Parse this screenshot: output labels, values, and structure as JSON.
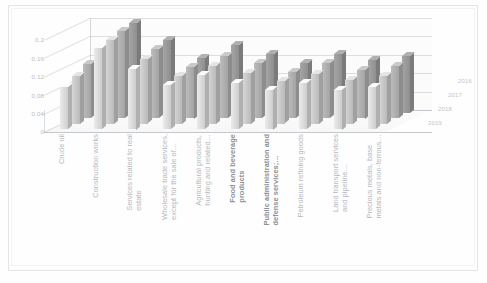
{
  "chart_data": {
    "type": "bar",
    "title": "",
    "subtitle": "",
    "xlabel": "",
    "ylabel": "",
    "ylim": [
      0,
      0.2
    ],
    "grid": true,
    "legend_position": "depth-axis-right",
    "yticks": [
      "0,2",
      "0,16",
      "0,12",
      "0,08",
      "0,04",
      "0"
    ],
    "ytick_values": [
      0.2,
      0.16,
      0.12,
      0.08,
      0.04,
      0
    ],
    "depth_axis_label": "",
    "categories": [
      "Crude oil",
      "Construction works",
      "Services related to real\nestate",
      "Wholesale trade services,\nexcept for the sale of…",
      "Agricultural products,\nhunting and related…",
      "Food and beverage\nproducts",
      "Public administration and\ndefense services;…",
      "Petroleum refining goods",
      "Land transport services\nand pipeline…",
      "Precious metals, base\nmetals and non-ferrous…"
    ],
    "categories_bold": [
      false,
      false,
      false,
      false,
      false,
      true,
      true,
      false,
      false,
      false
    ],
    "series": [
      {
        "name": "2016",
        "color": "#9a9a9a",
        "values": [
          0.128,
          0.196,
          0.158,
          0.118,
          0.148,
          0.128,
          0.108,
          0.128,
          0.114,
          0.124
        ]
      },
      {
        "name": "2017",
        "color": "#b0b0b0",
        "values": [
          0.118,
          0.19,
          0.15,
          0.112,
          0.135,
          0.12,
          0.1,
          0.12,
          0.106,
          0.114
        ]
      },
      {
        "name": "2018",
        "color": "#c8c8c8",
        "values": [
          0.104,
          0.182,
          0.14,
          0.104,
          0.126,
          0.11,
          0.092,
          0.108,
          0.096,
          0.104
        ]
      },
      {
        "name": "2019",
        "color": "#dcdcdc",
        "values": [
          0.092,
          0.176,
          0.132,
          0.096,
          0.118,
          0.1,
          0.086,
          0.1,
          0.086,
          0.092
        ]
      }
    ]
  },
  "legend": {
    "entries": [
      "2016",
      "2017",
      "2018",
      "2019"
    ]
  }
}
